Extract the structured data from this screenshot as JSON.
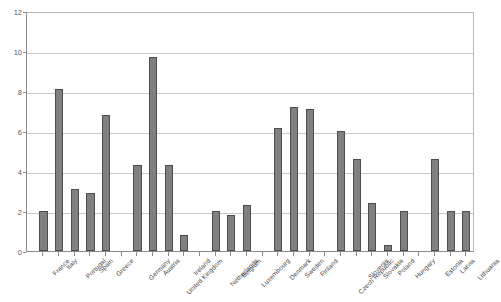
{
  "chart_data": {
    "type": "bar",
    "title": "",
    "xlabel": "",
    "ylabel": "",
    "ylim": [
      0,
      12
    ],
    "yticks": [
      0,
      2,
      4,
      6,
      8,
      10,
      12
    ],
    "grid": true,
    "legend": "none",
    "orientation": "vertical",
    "bar_color": "#808080",
    "bar_edge_color": "#4d4d4d",
    "categories": [
      "France",
      "Italy",
      "Portugal",
      "Spain",
      "Greece",
      "Germany",
      "Austria",
      "United Kingdom",
      "Ireland",
      "Netherlands",
      "Belgium",
      "Luxembourg",
      "Denmark",
      "Sweden",
      "Finland",
      "Czech Republic",
      "Slovenia",
      "Slovakia",
      "Poland",
      "Hungary",
      "Estonia",
      "Latvia",
      "Lithuania"
    ],
    "values": [
      2.0,
      8.1,
      3.1,
      2.9,
      6.8,
      4.3,
      9.7,
      4.3,
      0.8,
      2.0,
      1.8,
      2.3,
      6.15,
      7.2,
      7.1,
      6.0,
      4.6,
      2.4,
      0.3,
      2.0,
      4.6,
      2.0,
      2.0
    ],
    "group_breaks_after": [
      "Greece",
      "Ireland",
      "Luxembourg",
      "Finland",
      "Hungary"
    ]
  },
  "axis": {
    "y_tick_labels": [
      "0",
      "2",
      "4",
      "6",
      "8",
      "10",
      "12"
    ]
  }
}
